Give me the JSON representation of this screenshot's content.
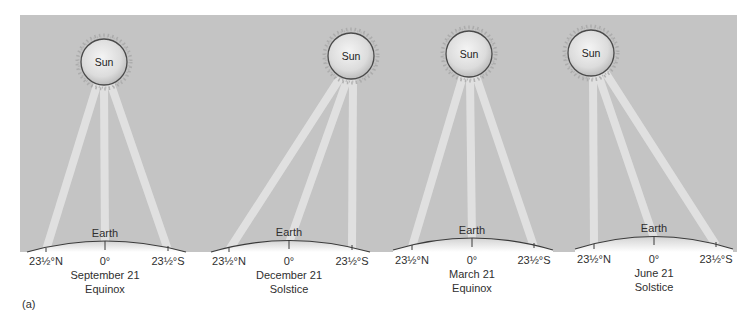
{
  "figure": {
    "caption": "(a)",
    "background_color": "#c4c4c4",
    "beam_color": "#e6e6e6",
    "earth_line_color": "#3a3a3a",
    "sun_label": "Sun",
    "earth_label": "Earth",
    "panels": [
      {
        "date": "September 21",
        "event": "Equinox",
        "labels": {
          "north": "23½°N",
          "equator": "0°",
          "south": "23½°S"
        },
        "sun_position": "directly over equator"
      },
      {
        "date": "December 21",
        "event": "Solstice",
        "labels": {
          "north": "23½°N",
          "equator": "0°",
          "south": "23½°S"
        },
        "sun_position": "directly over 23½°S"
      },
      {
        "date": "March 21",
        "event": "Equinox",
        "labels": {
          "north": "23½°N",
          "equator": "0°",
          "south": "23½°S"
        },
        "sun_position": "directly over equator"
      },
      {
        "date": "June 21",
        "event": "Solstice",
        "labels": {
          "north": "23½°N",
          "equator": "0°",
          "south": "23½°S"
        },
        "sun_position": "directly over 23½°N"
      }
    ]
  }
}
